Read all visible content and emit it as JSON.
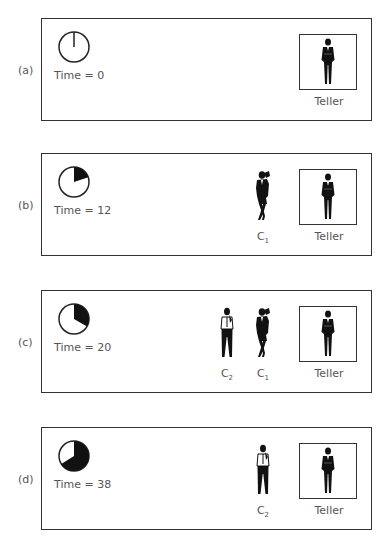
{
  "figure": {
    "panels": [
      {
        "id": "a",
        "label": "(a)",
        "time_label": "Time = 0",
        "time": 0,
        "clock_fraction": 0,
        "customers": []
      },
      {
        "id": "b",
        "label": "(b)",
        "time_label": "Time = 12",
        "time": 12,
        "clock_fraction": 0.2,
        "customers": [
          {
            "name": "C",
            "sub": "1"
          }
        ]
      },
      {
        "id": "c",
        "label": "(c)",
        "time_label": "Time = 20",
        "time": 20,
        "clock_fraction": 0.333,
        "customers": [
          {
            "name": "C",
            "sub": "2"
          },
          {
            "name": "C",
            "sub": "1"
          }
        ]
      },
      {
        "id": "d",
        "label": "(d)",
        "time_label": "Time = 38",
        "time": 38,
        "clock_fraction": 0.633,
        "customers": [
          {
            "name": "C",
            "sub": "2"
          }
        ]
      }
    ],
    "teller_label": "Teller",
    "colors": {
      "border": "#333333",
      "fill": "#111111",
      "text": "#555555"
    }
  }
}
